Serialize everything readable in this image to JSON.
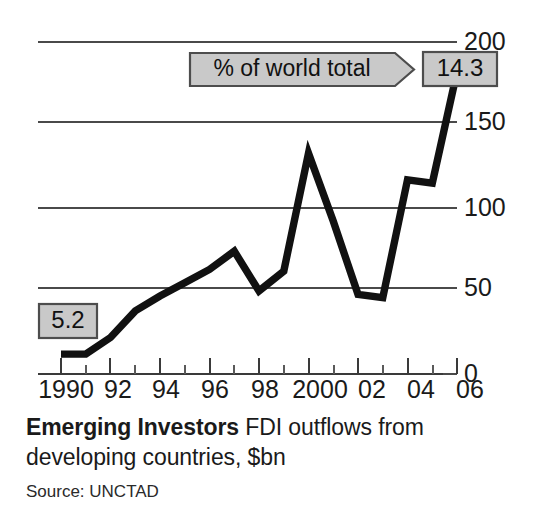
{
  "chart_data": {
    "type": "line",
    "title": "Emerging Investors",
    "subtitle": "FDI outflows from developing countries, $bn",
    "source": "Source: UNCTAD",
    "xlabel": "",
    "ylabel": "",
    "ylim": [
      0,
      200
    ],
    "yticks": [
      0,
      50,
      100,
      150,
      200
    ],
    "ytick_labels": [
      "0",
      "50",
      "100",
      "150",
      "200"
    ],
    "xlim": [
      1990,
      2006
    ],
    "xticks": [
      1990,
      1992,
      1994,
      1996,
      1998,
      2000,
      2002,
      2004,
      2006
    ],
    "xtick_labels": [
      "1990",
      "92",
      "94",
      "96",
      "98",
      "2000",
      "02",
      "04",
      "06"
    ],
    "minor_xticks": [
      1991,
      1993,
      1995,
      1997,
      1999,
      2001,
      2003,
      2005
    ],
    "grid": true,
    "legend": "none",
    "x": [
      1990,
      1991,
      1992,
      1993,
      1994,
      1995,
      1996,
      1997,
      1998,
      1999,
      2000,
      2001,
      2002,
      2003,
      2004,
      2005,
      2006
    ],
    "values": [
      12,
      12,
      22,
      38,
      47,
      55,
      63,
      74,
      50,
      62,
      133,
      92,
      48,
      46,
      117,
      115,
      182
    ],
    "series": [
      {
        "name": "FDI outflows from developing countries, $bn",
        "values": [
          12,
          12,
          22,
          38,
          47,
          55,
          63,
          74,
          50,
          62,
          133,
          92,
          48,
          46,
          117,
          115,
          182
        ]
      }
    ],
    "annotations": [
      {
        "name": "start-share-badge",
        "text": "5.2",
        "note": "% of world total at 1990"
      },
      {
        "name": "end-share-badge",
        "text": "14.3",
        "note": "% of world total at 2006"
      },
      {
        "name": "share-callout",
        "text": "% of world total"
      }
    ],
    "line_color": "#111111",
    "badge_fill": "#c9c9c9",
    "badge_border": "#4d4d4d"
  },
  "caption": {
    "title": "Emerging Investors",
    "description": "FDI outflows from",
    "description_line2": "developing countries, $bn",
    "source": "Source: UNCTAD"
  },
  "callout": {
    "label": "% of world total"
  },
  "badges": {
    "start": "5.2",
    "end": "14.3"
  },
  "axis": {
    "y": [
      "200",
      "150",
      "100",
      "50",
      "0"
    ],
    "x": [
      "1990",
      "92",
      "94",
      "96",
      "98",
      "2000",
      "02",
      "04",
      "06"
    ]
  }
}
